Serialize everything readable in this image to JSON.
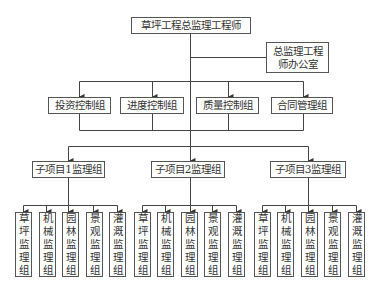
{
  "chart_data": {
    "type": "org-chart",
    "title": "",
    "root": {
      "label": "草坪工程总监理工程师",
      "staff": "总监理工程师办公室",
      "control_groups": [
        "投资控制组",
        "进度控制组",
        "质量控制组",
        "合同管理组"
      ],
      "subprojects": [
        {
          "label": "子项目1监理组",
          "teams": [
            "草坪监理组",
            "机械监理组",
            "园林监理组",
            "景观监理组",
            "灌溉监理组"
          ]
        },
        {
          "label": "子项目2监理组",
          "teams": [
            "草坪监理组",
            "机械监理组",
            "园林监理组",
            "景观监理组",
            "灌溉监理组"
          ]
        },
        {
          "label": "子项目3监理组",
          "teams": [
            "草坪监理组",
            "机械监理组",
            "园林监理组",
            "景观监理组",
            "灌溉监理组"
          ]
        }
      ]
    }
  },
  "nodes": {
    "root": "草坪工程总监理工程师",
    "office_line1": "总监理工程",
    "office_line2": "师办公室",
    "control": [
      "投资控制组",
      "进度控制组",
      "质量控制组",
      "合同管理组"
    ],
    "sub": [
      "子项目1监理组",
      "子项目2监理组",
      "子项目3监理组"
    ],
    "teams": [
      "草坪监理组",
      "机械监理组",
      "园林监理组",
      "景观监理组",
      "灌溉监理组"
    ]
  },
  "colors": {
    "line": "#444444",
    "border": "#555555",
    "text": "#333333"
  }
}
